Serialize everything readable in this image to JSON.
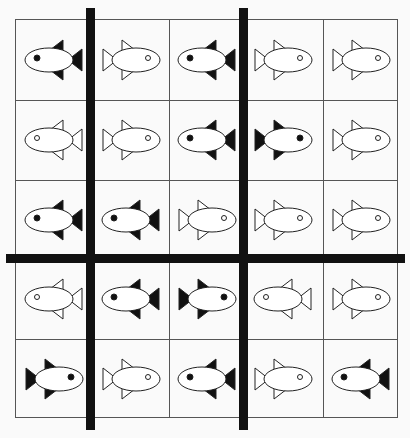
{
  "puzzle": {
    "rows": 5,
    "cols": 5,
    "colors": {
      "line": "#555555",
      "bar": "#111111",
      "fish_stroke": "#222222",
      "fish_body": "#ffffff",
      "fill_black": "#111111"
    },
    "fish": [
      [
        {
          "fill": "black",
          "facing": "left"
        },
        {
          "fill": "white",
          "facing": "right"
        },
        {
          "fill": "black",
          "facing": "left"
        },
        {
          "fill": "white",
          "facing": "right"
        },
        {
          "fill": "white",
          "facing": "right"
        }
      ],
      [
        {
          "fill": "white",
          "facing": "left"
        },
        {
          "fill": "white",
          "facing": "right"
        },
        {
          "fill": "black",
          "facing": "left"
        },
        {
          "fill": "black",
          "facing": "right"
        },
        {
          "fill": "white",
          "facing": "right"
        }
      ],
      [
        {
          "fill": "black",
          "facing": "left"
        },
        {
          "fill": "black",
          "facing": "left"
        },
        {
          "fill": "white",
          "facing": "right"
        },
        {
          "fill": "white",
          "facing": "right"
        },
        {
          "fill": "white",
          "facing": "right"
        }
      ],
      [
        {
          "fill": "white",
          "facing": "left"
        },
        {
          "fill": "black",
          "facing": "left"
        },
        {
          "fill": "black",
          "facing": "right"
        },
        {
          "fill": "white",
          "facing": "left"
        },
        {
          "fill": "white",
          "facing": "right"
        }
      ],
      [
        {
          "fill": "black",
          "facing": "right"
        },
        {
          "fill": "white",
          "facing": "right"
        },
        {
          "fill": "black",
          "facing": "left"
        },
        {
          "fill": "white",
          "facing": "right"
        },
        {
          "fill": "black",
          "facing": "left"
        }
      ]
    ]
  }
}
